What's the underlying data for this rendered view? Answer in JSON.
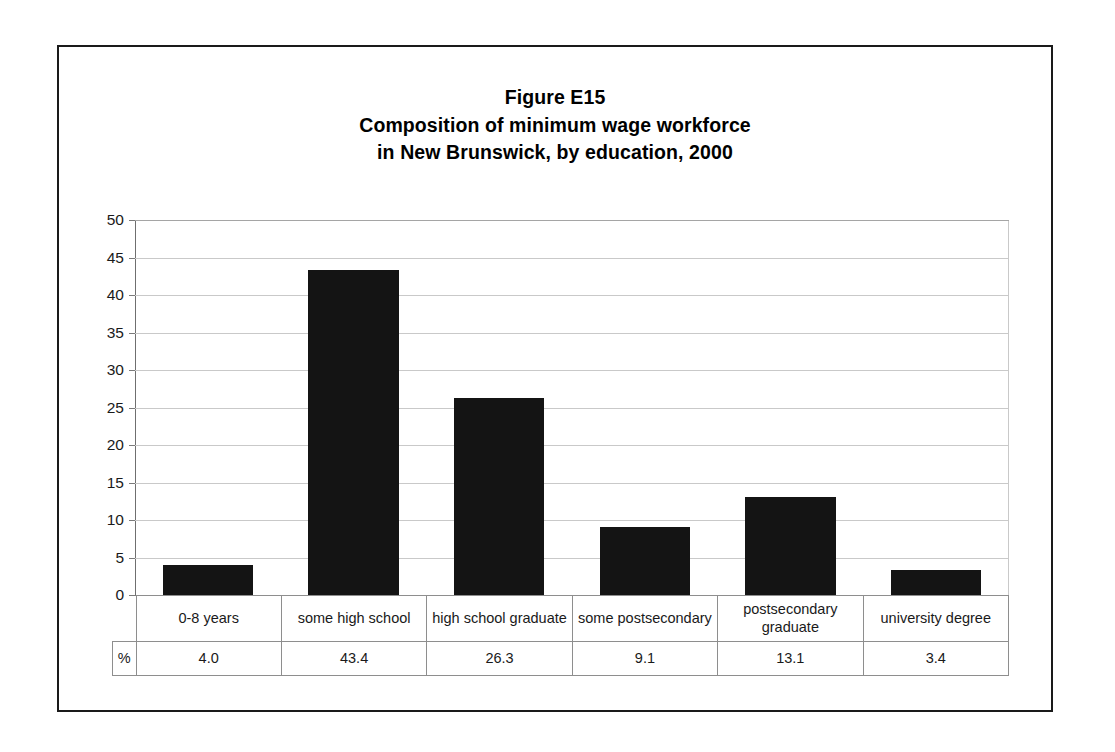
{
  "figure": {
    "title_lines": [
      "Figure E15",
      "Composition of minimum wage workforce",
      "in New Brunswick, by education, 2000"
    ],
    "unit_label": "%"
  },
  "chart_data": {
    "type": "bar",
    "title": "Figure E15 Composition of minimum wage workforce in New Brunswick, by education, 2000",
    "categories": [
      "0-8 years",
      "some high school",
      "high school graduate",
      "some postsecondary",
      "postsecondary graduate",
      "university degree"
    ],
    "values": [
      4.0,
      43.4,
      26.3,
      9.1,
      13.1,
      3.4
    ],
    "value_labels": [
      "4.0",
      "43.4",
      "26.3",
      "9.1",
      "13.1",
      "3.4"
    ],
    "xlabel": "",
    "ylabel": "",
    "ylim": [
      0,
      50
    ],
    "ytick_labels": [
      "50",
      "45",
      "40",
      "35",
      "30",
      "25",
      "20",
      "15",
      "10",
      "5",
      "0"
    ],
    "ytick_values": [
      50,
      45,
      40,
      35,
      30,
      25,
      20,
      15,
      10,
      5,
      0
    ],
    "grid": true,
    "legend": "none",
    "series_color": "#141414",
    "gridline_color": "#c9c9c9",
    "axis_color": "#7a7a7a"
  }
}
